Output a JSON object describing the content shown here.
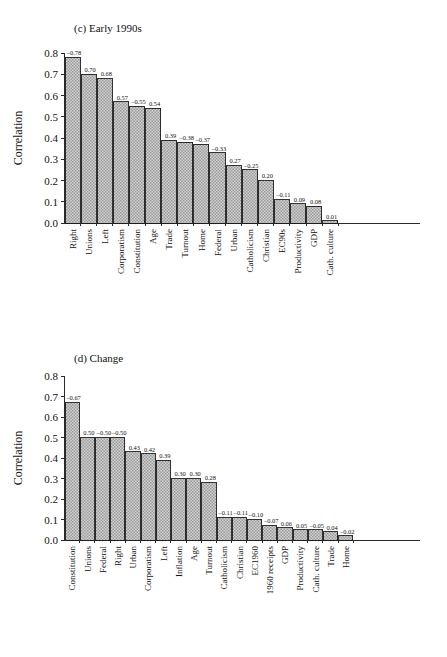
{
  "page": {
    "ghost_header": "",
    "bar_fill_color": "#bdbdbd",
    "bar_stroke_color": "#1c1c1c",
    "axis_color": "#2a2a2a",
    "text_color": "#111111"
  },
  "charts": [
    {
      "panel_label": "(c) Early 1990s",
      "chart_data": {
        "type": "bar",
        "title": "(c) Early 1990s",
        "xlabel": "",
        "ylabel": "Correlation",
        "ylim": [
          0.0,
          0.8
        ],
        "yticks": [
          "0.0",
          "0.1",
          "0.2",
          "0.3",
          "0.4",
          "0.5",
          "0.6",
          "0.7",
          "0.8"
        ],
        "grid": false,
        "legend": "none",
        "categories": [
          "Right",
          "Unions",
          "Left",
          "Corporatism",
          "Constitution",
          "Age",
          "Trade",
          "Turnout",
          "Home",
          "Federal",
          "Urban",
          "Catholicism",
          "Christian",
          "EC90s",
          "Productivity",
          "GDP",
          "Cath. culture"
        ],
        "values": [
          0.78,
          0.7,
          0.68,
          0.57,
          0.55,
          0.54,
          0.39,
          0.38,
          0.37,
          0.33,
          0.27,
          0.25,
          0.2,
          0.11,
          0.09,
          0.08,
          0.01
        ],
        "data_labels": [
          "–0.78",
          "0.70",
          "0.68",
          "0.57",
          "–0.55",
          "0.54",
          "0.39",
          "–0.38",
          "–0.37",
          "–0.33",
          "0.27",
          "–0.25",
          "0.20",
          "–0.11",
          "0.09",
          "0.08",
          "0.01"
        ]
      }
    },
    {
      "panel_label": "(d) Change",
      "chart_data": {
        "type": "bar",
        "title": "(d) Change",
        "xlabel": "",
        "ylabel": "Correlation",
        "ylim": [
          0.0,
          0.8
        ],
        "yticks": [
          "0.0",
          "0.1",
          "0.2",
          "0.3",
          "0.4",
          "0.5",
          "0.6",
          "0.7",
          "0.8"
        ],
        "grid": false,
        "legend": "none",
        "categories": [
          "Constitution",
          "Unions",
          "Federal",
          "Right",
          "Urban",
          "Corporatism",
          "Left",
          "Inflation",
          "Age",
          "Turnout",
          "Catholicism",
          "Christian",
          "EC1960",
          "1960 receipts",
          "GDP",
          "Productivity",
          "Cath. culture",
          "Trade",
          "Home"
        ],
        "values": [
          0.67,
          0.5,
          0.5,
          0.5,
          0.43,
          0.42,
          0.39,
          0.3,
          0.3,
          0.28,
          0.11,
          0.11,
          0.1,
          0.07,
          0.06,
          0.05,
          0.05,
          0.04,
          0.02
        ],
        "data_labels": [
          "–0.67",
          "0.50",
          "–0.50",
          "–0.50",
          "0.43",
          "0.42",
          "0.39",
          "0.30",
          "0.30",
          "0.28",
          "–0.11",
          "–0.11",
          "–0.10",
          "–0.07",
          "0.06",
          "0.05",
          "–0.05",
          "0.04",
          "–0.02"
        ]
      }
    }
  ]
}
